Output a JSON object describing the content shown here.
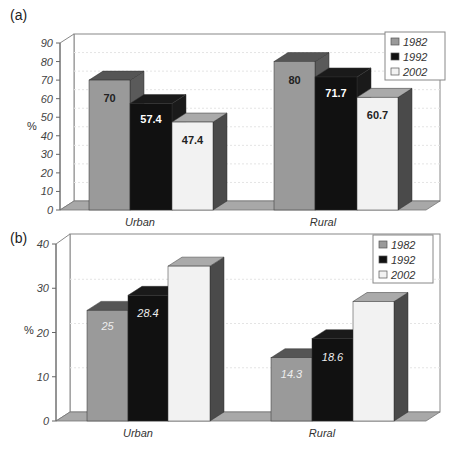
{
  "colors": {
    "s1982_front": "#9a9a9a",
    "s1982_top": "#555555",
    "s1982_side": "#5a5a5a",
    "s1992_front": "#111111",
    "s1992_top": "#1a1a1a",
    "s1992_side": "#1a1a1a",
    "s2002_front": "#f2f2f2",
    "s2002_top": "#aaaaaa",
    "s2002_side": "#4a4a4a",
    "floor": "#a8a8a8",
    "wall_line": "#888888",
    "grid": "#e4e4e4"
  },
  "chart_data": [
    {
      "panel_label": "(a)",
      "type": "bar",
      "title": "",
      "xlabel": "",
      "ylabel": "%",
      "ylim": [
        0,
        90
      ],
      "yticks": [
        "0",
        "10",
        "20",
        "30",
        "40",
        "50",
        "60",
        "70",
        "80",
        "90"
      ],
      "categories": [
        "Urban",
        "Rural"
      ],
      "series": [
        {
          "name": "1982",
          "values": [
            70,
            80
          ],
          "labels": [
            "70",
            "80"
          ]
        },
        {
          "name": "1992",
          "values": [
            57.4,
            71.7
          ],
          "labels": [
            "57.4",
            "71.7"
          ]
        },
        {
          "name": "2002",
          "values": [
            47.4,
            60.7
          ],
          "labels": [
            "47.4",
            "60.7"
          ]
        }
      ],
      "legend": [
        "1982",
        "1992",
        "2002"
      ],
      "legend_position": "top-right",
      "grid": true,
      "style": "3d"
    },
    {
      "panel_label": "(b)",
      "type": "bar",
      "title": "",
      "xlabel": "",
      "ylabel": "%",
      "ylim": [
        0,
        40
      ],
      "yticks": [
        "0",
        "10",
        "20",
        "30",
        "40"
      ],
      "categories": [
        "Urban",
        "Rural"
      ],
      "series": [
        {
          "name": "1982",
          "values": [
            25,
            14.3
          ],
          "labels": [
            "25",
            "14.3"
          ]
        },
        {
          "name": "1992",
          "values": [
            28.4,
            18.6
          ],
          "labels": [
            "28.4",
            "18.6"
          ]
        },
        {
          "name": "2002",
          "values": [
            35,
            27
          ],
          "labels": [
            "",
            ""
          ]
        }
      ],
      "legend": [
        "1982",
        "1992",
        "2002"
      ],
      "legend_position": "top-right",
      "grid": true,
      "style": "3d"
    }
  ]
}
